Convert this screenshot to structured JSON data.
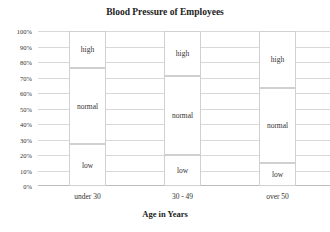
{
  "chart_data": {
    "type": "bar",
    "stacked": true,
    "percent": true,
    "title": "Blood Pressure of Employees",
    "xlabel": "Age in Years",
    "ylabel": "",
    "ylim": [
      0,
      100
    ],
    "yticks": [
      "0%",
      "10%",
      "20%",
      "30%",
      "40%",
      "50%",
      "60%",
      "70%",
      "80%",
      "90%",
      "100%"
    ],
    "categories": [
      "under 30",
      "30 - 49",
      "over 50"
    ],
    "series": [
      {
        "name": "low",
        "values": [
          27,
          20,
          15
        ]
      },
      {
        "name": "normal",
        "values": [
          49,
          51,
          48
        ]
      },
      {
        "name": "high",
        "values": [
          24,
          29,
          37
        ]
      }
    ],
    "grid": true,
    "legend": "none (labels inside segments)"
  }
}
